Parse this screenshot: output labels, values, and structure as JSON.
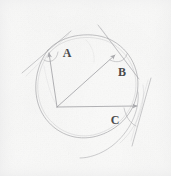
{
  "figure": {
    "kind": "hand-drawn-geometry-sketch",
    "medium": "pencil on paper",
    "background_color": "#fbfbfa",
    "stroke_color": "#9a9a9e",
    "label_color": "#4a4a4c",
    "width": 171,
    "height": 176,
    "labels": [
      {
        "id": "A",
        "text": "A",
        "x": 66,
        "y": 53
      },
      {
        "id": "B",
        "text": "B",
        "x": 122,
        "y": 72
      },
      {
        "id": "C",
        "text": "C",
        "x": 115,
        "y": 120
      }
    ],
    "circle": {
      "center_x": 88,
      "center_y": 88,
      "radius": 52
    },
    "origin_point": {
      "x": 57,
      "y": 107
    },
    "vectors": [
      {
        "name": "vector-to-A",
        "from_x": 57,
        "from_y": 107,
        "to_x": 48,
        "to_y": 50,
        "arrowhead": true
      },
      {
        "name": "vector-to-B",
        "from_x": 57,
        "from_y": 107,
        "to_x": 117,
        "to_y": 53,
        "arrowhead": true
      },
      {
        "name": "vector-to-C",
        "from_x": 57,
        "from_y": 107,
        "to_x": 140,
        "to_y": 106,
        "arrowhead": true
      }
    ],
    "tangent_lines": [
      {
        "name": "tangent-at-A",
        "x1": 22,
        "y1": 72,
        "x2": 70,
        "y2": 32
      },
      {
        "name": "tangent-at-B",
        "x1": 98,
        "y1": 26,
        "x2": 137,
        "y2": 76
      },
      {
        "name": "tangent-at-C",
        "x1": 150,
        "y1": 80,
        "x2": 133,
        "y2": 143
      }
    ],
    "angle_arcs": [
      {
        "name": "angle-arc-A",
        "at": "A"
      },
      {
        "name": "angle-arc-B",
        "at": "B"
      },
      {
        "name": "angle-arc-C",
        "at": "C"
      }
    ]
  }
}
